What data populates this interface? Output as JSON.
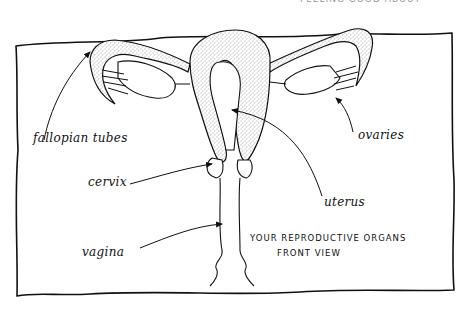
{
  "diagram": {
    "title_line1": "YOUR REPRODUCTIVE ORGANS",
    "title_line2": "FRONT VIEW",
    "header_fragment": "FEELING GOOD ABOUT OURSELVES",
    "labels": {
      "fallopian_tubes": "fallopian tubes",
      "ovaries": "ovaries",
      "cervix": "cervix",
      "uterus": "uterus",
      "vagina": "vagina"
    },
    "colors": {
      "ink": "#111111",
      "paper": "#ffffff",
      "stipple": "#555555"
    }
  }
}
